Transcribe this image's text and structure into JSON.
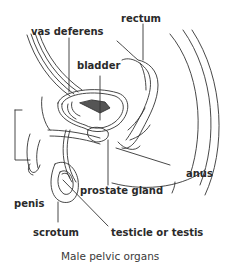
{
  "diagram": {
    "caption": "Male pelvic organs",
    "labels": {
      "rectum": "rectum",
      "vas_deferens": "vas deferens",
      "bladder": "bladder",
      "anus": "anus",
      "prostate_gland": "prostate gland",
      "penis": "penis",
      "scrotum": "scrotum",
      "testicle": "testicle or testis"
    },
    "colors": {
      "line": "#333333",
      "text": "#2a2a2a",
      "background": "#ffffff"
    }
  }
}
